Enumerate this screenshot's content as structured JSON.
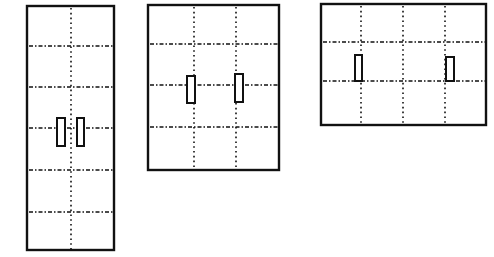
{
  "figure": {
    "width": 494,
    "height": 257,
    "stroke_color": "#111111",
    "background": "#ffffff",
    "panels": [
      {
        "id": "panel-1",
        "x": 27,
        "y": 6,
        "w": 87,
        "h": 244,
        "vlines": [
          71
        ],
        "hlines": [
          46,
          87,
          128,
          170,
          212
        ],
        "rects": [
          {
            "x": 57,
            "y": 118,
            "w": 8,
            "h": 28
          },
          {
            "x": 77,
            "y": 118,
            "w": 7,
            "h": 28
          }
        ]
      },
      {
        "id": "panel-2",
        "x": 148,
        "y": 5,
        "w": 131,
        "h": 165,
        "vlines": [
          194,
          236
        ],
        "hlines": [
          44,
          85,
          127
        ],
        "rects": [
          {
            "x": 187,
            "y": 76,
            "w": 8,
            "h": 27
          },
          {
            "x": 235,
            "y": 74,
            "w": 8,
            "h": 28
          }
        ]
      },
      {
        "id": "panel-3",
        "x": 321,
        "y": 4,
        "w": 165,
        "h": 121,
        "vlines": [
          361,
          403,
          445
        ],
        "hlines": [
          42,
          81
        ],
        "rects": [
          {
            "x": 355,
            "y": 55,
            "w": 7,
            "h": 26
          },
          {
            "x": 446,
            "y": 57,
            "w": 8,
            "h": 24
          }
        ]
      }
    ]
  }
}
